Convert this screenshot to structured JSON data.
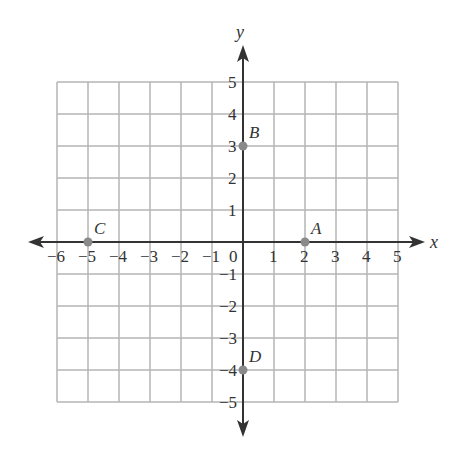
{
  "diagram": {
    "type": "coordinate-plane",
    "axes": {
      "x_label": "x",
      "y_label": "y",
      "x_range": [
        -6,
        5
      ],
      "y_range": [
        -5,
        5
      ],
      "x_ticks": [
        "−6",
        "−5",
        "−4",
        "−3",
        "−2",
        "−1",
        "0",
        "1",
        "2",
        "3",
        "4",
        "5"
      ],
      "y_ticks_positive": [
        "1",
        "2",
        "3",
        "4",
        "5"
      ],
      "y_ticks_negative": [
        "−1",
        "−2",
        "−3",
        "−4",
        "−5"
      ]
    },
    "points": [
      {
        "label": "A",
        "x": 2,
        "y": 0
      },
      {
        "label": "B",
        "x": 0,
        "y": 3
      },
      {
        "label": "C",
        "x": -5,
        "y": 0
      },
      {
        "label": "D",
        "x": 0,
        "y": -4
      }
    ],
    "colors": {
      "grid": "#b5b5b5",
      "axis": "#333333",
      "point": "#8a8a8a"
    }
  }
}
